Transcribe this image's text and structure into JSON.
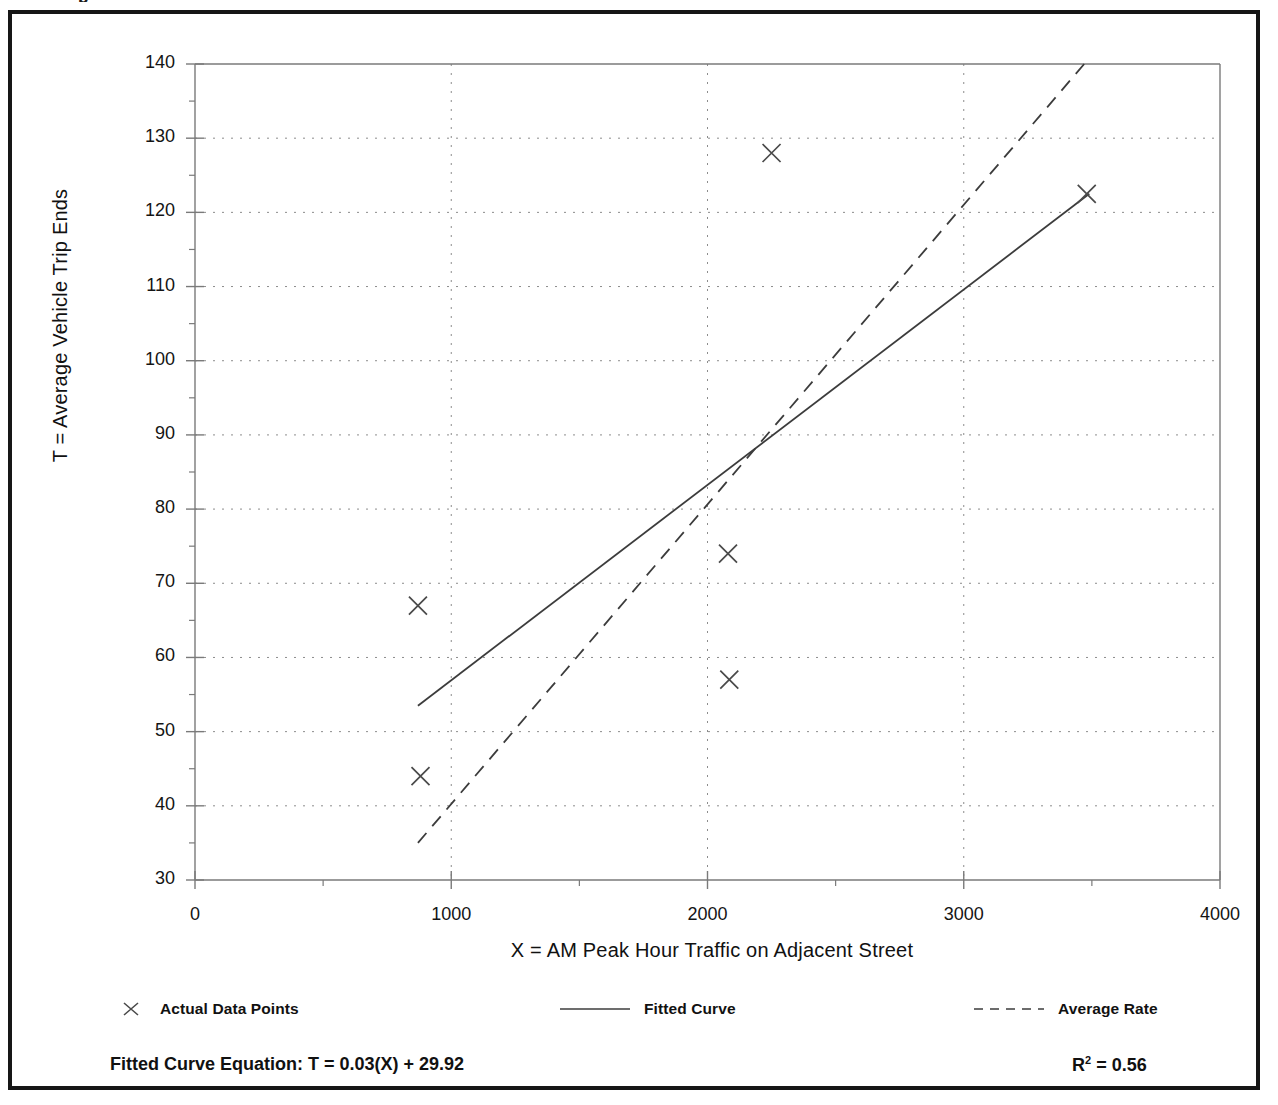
{
  "page": {
    "top_clipped_text": "p"
  },
  "chart_data": {
    "type": "scatter",
    "title": "",
    "xlabel": "X = AM Peak Hour Traffic on Adjacent Street",
    "ylabel": "T = Average Vehicle Trip Ends",
    "xlim": [
      0,
      4000
    ],
    "ylim": [
      30,
      140
    ],
    "x_ticks": [
      0,
      1000,
      2000,
      3000,
      4000
    ],
    "y_ticks": [
      30,
      40,
      50,
      60,
      70,
      80,
      90,
      100,
      110,
      120,
      130,
      140
    ],
    "x_minor_step": 500,
    "y_minor_step": 5,
    "grid": true,
    "grid_style": "dotted",
    "legend_position": "below-axes",
    "series": [
      {
        "name": "Actual Data Points",
        "type": "scatter",
        "marker": "x",
        "points": [
          {
            "x": 880,
            "y": 44
          },
          {
            "x": 870,
            "y": 67
          },
          {
            "x": 2085,
            "y": 57
          },
          {
            "x": 2080,
            "y": 74
          },
          {
            "x": 2250,
            "y": 128
          },
          {
            "x": 3480,
            "y": 122.5
          }
        ]
      },
      {
        "name": "Fitted Curve",
        "type": "line",
        "style": "solid",
        "endpoints": [
          {
            "x": 870,
            "y": 53.5
          },
          {
            "x": 3490,
            "y": 122.5
          }
        ]
      },
      {
        "name": "Average Rate",
        "type": "line",
        "style": "dashed",
        "endpoints": [
          {
            "x": 870,
            "y": 35
          },
          {
            "x": 3470,
            "y": 140
          }
        ]
      }
    ],
    "annotations": {
      "fitted_equation": "Fitted Curve Equation:  T = 0.03(X) + 29.92",
      "r_squared_symbol": "R",
      "r_squared_exponent": "2",
      "r_squared_value": "= 0.56"
    }
  },
  "legend": {
    "actual_label": "Actual Data Points",
    "fitted_label": "Fitted Curve",
    "average_label": "Average Rate"
  },
  "colors": {
    "frame": "#161616",
    "axis": "#7a7a7a",
    "grid": "#8c8c8c",
    "series_line": "#3c3c3c",
    "marker": "#4a4a4a",
    "text": "#111111"
  }
}
